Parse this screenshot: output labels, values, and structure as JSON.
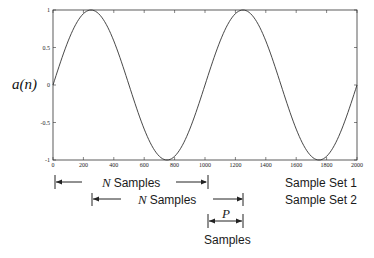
{
  "chart_data": {
    "type": "line",
    "title": "",
    "xlabel": "",
    "ylabel": "a(n)",
    "xlim": [
      0,
      2000
    ],
    "ylim": [
      -1,
      1
    ],
    "x_ticks": [
      "0",
      "200",
      "400",
      "600",
      "800",
      "1000",
      "1200",
      "1400",
      "1600",
      "1800",
      "2000"
    ],
    "y_ticks": [
      "-1",
      "-0.5",
      "0",
      "0.5",
      "1"
    ],
    "grid": false,
    "series": [
      {
        "name": "a(n)",
        "function": "sin(2*pi*n/1000)",
        "x": [
          0,
          250,
          500,
          750,
          1000,
          1250,
          1500,
          1750,
          2000
        ],
        "values": [
          0,
          1,
          0,
          -1,
          0,
          1,
          0,
          -1,
          0
        ]
      }
    ],
    "annotations": [
      {
        "text": "N Samples",
        "span": [
          0,
          1000
        ],
        "label": "Sample Set 1"
      },
      {
        "text": "N Samples",
        "span": [
          250,
          1250
        ],
        "label": "Sample Set 2"
      },
      {
        "text": "P Samples",
        "span": [
          1000,
          1250
        ]
      }
    ]
  },
  "labels": {
    "ylabel": "a(n)",
    "n_samples_1": "Samples",
    "n_samples_2": "Samples",
    "n_var": "N",
    "set1": "Sample Set 1",
    "set2": "Sample Set 2",
    "p_var": "P",
    "p_samples": "Samples"
  }
}
